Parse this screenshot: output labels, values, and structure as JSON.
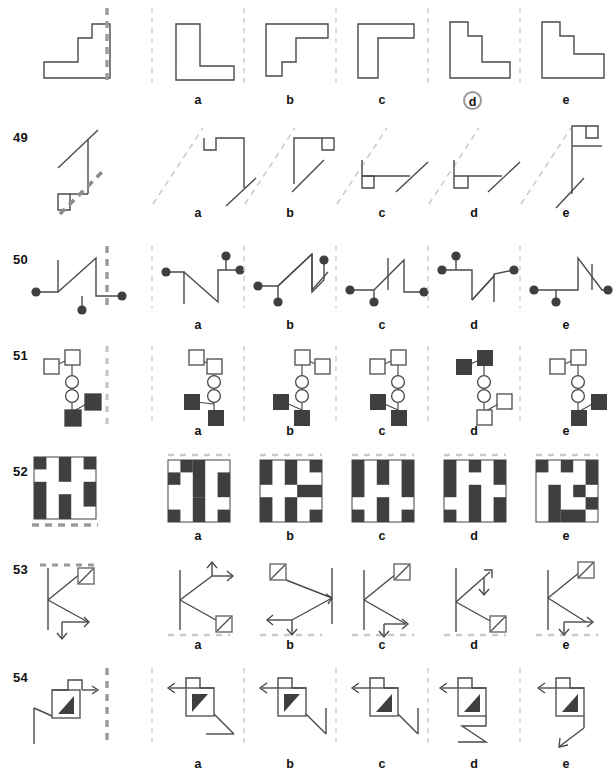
{
  "page": {
    "type": "spatial-reasoning-test-worksheet",
    "width": 614,
    "height": 779,
    "option_letters": [
      "a",
      "b",
      "c",
      "d",
      "e"
    ],
    "marked_answer": {
      "row": "48",
      "letter": "d"
    }
  },
  "rows": [
    {
      "number": "",
      "number_visible": false,
      "mirror_axis": "vertical-dashed",
      "figure_kind": "polygon-outline",
      "options": [
        "a",
        "b",
        "c",
        "d",
        "e"
      ],
      "selected": "d"
    },
    {
      "number": "49",
      "number_visible": true,
      "mirror_axis": "diagonal-dashed",
      "figure_kind": "line-and-hook",
      "options": [
        "a",
        "b",
        "c",
        "d",
        "e"
      ],
      "selected": null
    },
    {
      "number": "50",
      "number_visible": true,
      "mirror_axis": "vertical-dashed",
      "figure_kind": "zigzag-with-dots",
      "options": [
        "a",
        "b",
        "c",
        "d",
        "e"
      ],
      "selected": null
    },
    {
      "number": "51",
      "number_visible": true,
      "mirror_axis": "vertical-dashed",
      "figure_kind": "squares-circles-chain",
      "options": [
        "a",
        "b",
        "c",
        "d",
        "e"
      ],
      "selected": null
    },
    {
      "number": "52",
      "number_visible": true,
      "mirror_axis": "horizontal-dashed",
      "figure_kind": "grid-pattern",
      "options": [
        "a",
        "b",
        "c",
        "d",
        "e"
      ],
      "selected": null
    },
    {
      "number": "53",
      "number_visible": true,
      "mirror_axis": "horizontal-dashed",
      "figure_kind": "arrows-and-boxes",
      "options": [
        "a",
        "b",
        "c",
        "d",
        "e"
      ],
      "selected": null
    },
    {
      "number": "54",
      "number_visible": true,
      "mirror_axis": "vertical-dashed",
      "figure_kind": "box-with-triangle-and-arrow",
      "options": [
        "a",
        "b",
        "c",
        "d",
        "e"
      ],
      "selected": null
    }
  ],
  "colors": {
    "stroke": "#3d3d3d",
    "fill_dark": "#3f3f3f",
    "dash_light": "#c9c9c9",
    "dash_dark": "#8d8d8d",
    "text": "#111111",
    "circle_marker": "#9a9a9a"
  }
}
